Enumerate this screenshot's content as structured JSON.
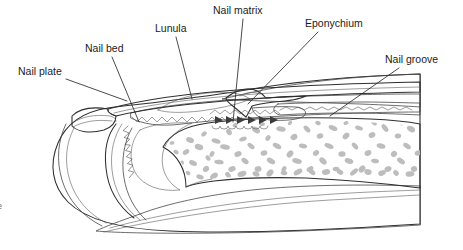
{
  "figure": {
    "type": "anatomical-line-diagram",
    "width": 463,
    "height": 250,
    "background_color": "#ffffff",
    "line_color": "#2f2f2f",
    "text_color": "#1b1b1b"
  },
  "labels": [
    {
      "id": "nail-plate",
      "text": "Nail plate",
      "text_x": 18,
      "text_y": 75,
      "leader": "M 66,79 L 127,101"
    },
    {
      "id": "nail-bed",
      "text": "Nail bed",
      "text_x": 85,
      "text_y": 52,
      "leader": "M 112,57 L 139,122"
    },
    {
      "id": "lunula",
      "text": "Lunula",
      "text_x": 155,
      "text_y": 32,
      "leader": "M 176,37 L 192,99"
    },
    {
      "id": "nail-matrix",
      "text": "Nail matrix",
      "text_x": 213,
      "text_y": 14,
      "leader": "M 243,19 L 233,122"
    },
    {
      "id": "eponychium",
      "text": "Eponychium",
      "text_x": 305,
      "text_y": 27,
      "leader": "M 318,32 L 248,104"
    },
    {
      "id": "nail-groove",
      "text": "Nail groove",
      "text_x": 385,
      "text_y": 63,
      "leader": "M 399,68 L 330,116"
    }
  ],
  "cut_text": {
    "text": "e",
    "x": 0,
    "y": 209
  },
  "shading": {
    "skin_outer": "#c8c8c8",
    "skin_mid": "#bdbdbd",
    "skin_light": "#d9d9d9",
    "nail_plate": "#d2d2d2",
    "nail_plate_edge": "#b4b4b4",
    "lunula": "#ececec",
    "nail_bed": "#cfcfcf",
    "bone_background": "#f4f4f4",
    "bone_trabecula": "#bcbcbc",
    "pulp": "#cccccc",
    "dark_fold": "#9a9a9a",
    "matrix_arrow": "#3a3a3a"
  },
  "features": {
    "matrix_arrow_count": 6,
    "serration_note": "sawtooth nail bed ridges along the distal nail plate underside",
    "trabecula_count": 96
  }
}
